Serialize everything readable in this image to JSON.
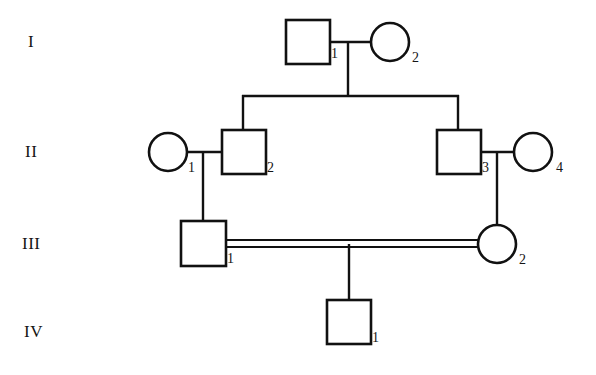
{
  "figure": {
    "kind": "pedigree-chart",
    "width": 596,
    "height": 375,
    "background_color": "#ffffff",
    "line_color": "#111111",
    "symbol_fill": "#ffffff"
  },
  "generations": [
    {
      "numeral": "I",
      "label_x": 28,
      "label_y": 32
    },
    {
      "numeral": "II",
      "label_x": 25,
      "label_y": 142
    },
    {
      "numeral": "III",
      "label_x": 22,
      "label_y": 234
    },
    {
      "numeral": "IV",
      "label_x": 24,
      "label_y": 322
    }
  ],
  "individuals": [
    {
      "id": "I-1",
      "generation": "I",
      "number": "1",
      "sex": "male",
      "shape": "square",
      "affected": false,
      "cx": 308,
      "cy": 42,
      "size": 44,
      "num_x": 331,
      "num_y": 46
    },
    {
      "id": "I-2",
      "generation": "I",
      "number": "2",
      "sex": "female",
      "shape": "circle",
      "affected": false,
      "cx": 390,
      "cy": 42,
      "r": 19,
      "num_x": 412,
      "num_y": 50
    },
    {
      "id": "II-1",
      "generation": "II",
      "number": "1",
      "sex": "female",
      "shape": "circle",
      "affected": false,
      "cx": 168,
      "cy": 152,
      "r": 19,
      "num_x": 188,
      "num_y": 160
    },
    {
      "id": "II-2",
      "generation": "II",
      "number": "2",
      "sex": "male",
      "shape": "square",
      "affected": false,
      "cx": 244,
      "cy": 152,
      "size": 44,
      "num_x": 267,
      "num_y": 160
    },
    {
      "id": "II-3",
      "generation": "II",
      "number": "3",
      "sex": "male",
      "shape": "square",
      "affected": false,
      "cx": 459,
      "cy": 152,
      "size": 44,
      "num_x": 482,
      "num_y": 160
    },
    {
      "id": "II-4",
      "generation": "II",
      "number": "4",
      "sex": "female",
      "shape": "circle",
      "affected": false,
      "cx": 533,
      "cy": 152,
      "r": 19,
      "num_x": 556,
      "num_y": 160
    },
    {
      "id": "III-1",
      "generation": "III",
      "number": "1",
      "sex": "male",
      "shape": "square",
      "affected": false,
      "cx": 203,
      "cy": 243,
      "size": 45,
      "num_x": 227,
      "num_y": 251
    },
    {
      "id": "III-2",
      "generation": "III",
      "number": "2",
      "sex": "female",
      "shape": "circle",
      "affected": false,
      "cx": 497,
      "cy": 244,
      "r": 19,
      "num_x": 519,
      "num_y": 252
    },
    {
      "id": "IV-1",
      "generation": "IV",
      "number": "1",
      "sex": "male",
      "shape": "square",
      "affected": false,
      "cx": 349,
      "cy": 322,
      "size": 44,
      "num_x": 372,
      "num_y": 330
    }
  ],
  "matings": [
    {
      "name": "mating-I1-I2",
      "partners": [
        "I-1",
        "I-2"
      ],
      "consanguineous": false,
      "line": {
        "x1": 330,
        "x2": 371,
        "y": 42
      },
      "descent": {
        "x": 348,
        "y1": 42,
        "y2": 96
      }
    },
    {
      "name": "mating-II1-II2",
      "partners": [
        "II-1",
        "II-2"
      ],
      "consanguineous": false,
      "line": {
        "x1": 187,
        "x2": 222,
        "y": 152
      },
      "descent": {
        "x": 203,
        "y1": 152,
        "y2": 221
      }
    },
    {
      "name": "mating-II3-II4",
      "partners": [
        "II-3",
        "II-4"
      ],
      "consanguineous": false,
      "line": {
        "x1": 481,
        "x2": 514,
        "y": 152
      },
      "descent": {
        "x": 497,
        "y1": 152,
        "y2": 225
      }
    },
    {
      "name": "mating-III1-III2",
      "partners": [
        "III-1",
        "III-2"
      ],
      "consanguineous": true,
      "double_line": {
        "x1": 226,
        "x2": 478,
        "y_top": 240,
        "y_bottom": 247
      },
      "descent": {
        "x": 349,
        "y1": 247,
        "y2": 300
      }
    }
  ],
  "sibships": [
    {
      "name": "sibship-generation-II",
      "parents": "mating-I1-I2",
      "horizontal": {
        "x1": 243,
        "x2": 458,
        "y": 96
      },
      "drops": [
        {
          "child": "II-2",
          "x": 243,
          "y1": 96,
          "y2": 130
        },
        {
          "child": "II-3",
          "x": 458,
          "y1": 96,
          "y2": 130
        }
      ]
    }
  ],
  "legend": {
    "square_meaning": "male",
    "circle_meaning": "female",
    "double_line_meaning": "consanguineous mating"
  }
}
